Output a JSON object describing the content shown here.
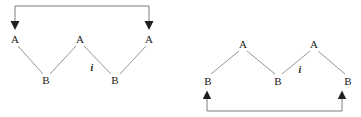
{
  "canvas": {
    "width": 361,
    "height": 117,
    "background": "#ffffff"
  },
  "style": {
    "line_color": "#8a8a8a",
    "arrow_color": "#2b2b2b",
    "text_color": "#1a1a1a",
    "line_width": 0.9,
    "arrow_line_width": 0.9
  },
  "diagrams": [
    {
      "id": "left-diagram",
      "name": "zigzag-with-top-arc-arrow",
      "nodes": [
        {
          "id": "L-A1",
          "label": "A",
          "x": 15,
          "y": 39
        },
        {
          "id": "L-A2",
          "label": "A",
          "x": 80,
          "y": 39
        },
        {
          "id": "L-A3",
          "label": "A",
          "x": 149,
          "y": 39
        },
        {
          "id": "L-B1",
          "label": "B",
          "x": 46,
          "y": 80
        },
        {
          "id": "L-B2",
          "label": "B",
          "x": 115,
          "y": 80
        }
      ],
      "edges": [
        {
          "from": "L-A1",
          "to": "L-B1",
          "label": ""
        },
        {
          "from": "L-A2",
          "to": "L-B1",
          "label": ""
        },
        {
          "from": "L-A2",
          "to": "L-B2",
          "label": "i"
        },
        {
          "from": "L-A3",
          "to": "L-B2",
          "label": ""
        }
      ],
      "edge_labels": [
        {
          "text": "i",
          "x": 92,
          "y": 68
        }
      ],
      "connector": {
        "id": "L-top-connector",
        "orientation": "top",
        "direction": "down",
        "left_x": 15,
        "right_x": 149,
        "bar_y": 6,
        "arrow_tip_y": 29,
        "arrowheads": [
          "left",
          "right"
        ]
      }
    },
    {
      "id": "right-diagram",
      "name": "zigzag-with-bottom-arc-arrow",
      "nodes": [
        {
          "id": "R-A1",
          "label": "A",
          "x": 243,
          "y": 44
        },
        {
          "id": "R-A2",
          "label": "A",
          "x": 314,
          "y": 44
        },
        {
          "id": "R-B1",
          "label": "B",
          "x": 208,
          "y": 81
        },
        {
          "id": "R-B2",
          "label": "B",
          "x": 278,
          "y": 81
        },
        {
          "id": "R-B3",
          "label": "B",
          "x": 348,
          "y": 81
        }
      ],
      "edges": [
        {
          "from": "R-A1",
          "to": "R-B1",
          "label": ""
        },
        {
          "from": "R-A1",
          "to": "R-B2",
          "label": ""
        },
        {
          "from": "R-A2",
          "to": "R-B2",
          "label": "i"
        },
        {
          "from": "R-A2",
          "to": "R-B3",
          "label": ""
        }
      ],
      "edge_labels": [
        {
          "text": "i",
          "x": 300,
          "y": 70
        }
      ],
      "connector": {
        "id": "R-bottom-connector",
        "orientation": "bottom",
        "direction": "up",
        "left_x": 207,
        "right_x": 342,
        "bar_y": 111,
        "arrow_tip_y": 93,
        "arrowheads": [
          "left",
          "right"
        ]
      }
    }
  ]
}
